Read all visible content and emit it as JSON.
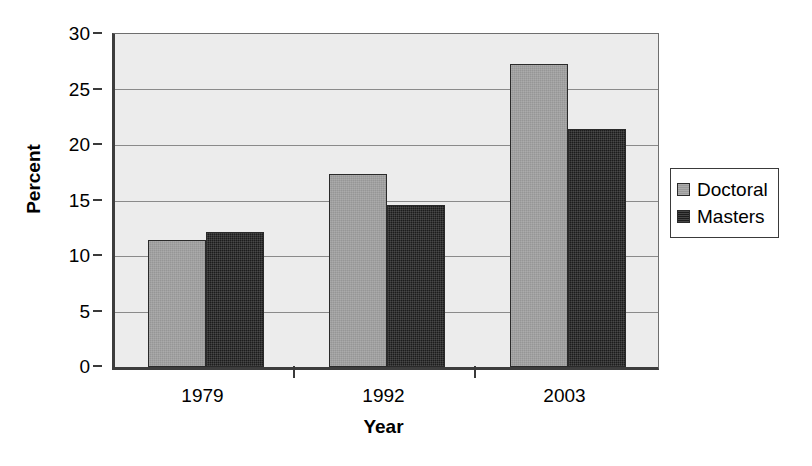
{
  "chart_data": {
    "type": "bar",
    "title": "",
    "subtitle": "",
    "xlabel": "Year",
    "ylabel": "Percent",
    "categories": [
      "1979",
      "1992",
      "2003"
    ],
    "series": [
      {
        "name": "Doctoral",
        "values": [
          11.4,
          17.4,
          27.3
        ],
        "color": "#969696"
      },
      {
        "name": "Masters",
        "values": [
          12.2,
          14.6,
          21.4
        ],
        "color": "#1c1c1c"
      }
    ],
    "ylim": [
      0,
      30
    ],
    "yticks": [
      0,
      5,
      10,
      15,
      20,
      25,
      30
    ],
    "ytick_labels": [
      "0",
      "5",
      "10",
      "15",
      "20",
      "25",
      "30"
    ],
    "grid": true,
    "grid_axis": "y",
    "legend_position": "right",
    "plot_background": "#ececec",
    "axis_color": "#3d3d3d",
    "gridline_color": "#8a8a8a"
  },
  "legend": {
    "entries": [
      {
        "label": "Doctoral"
      },
      {
        "label": "Masters"
      }
    ]
  }
}
